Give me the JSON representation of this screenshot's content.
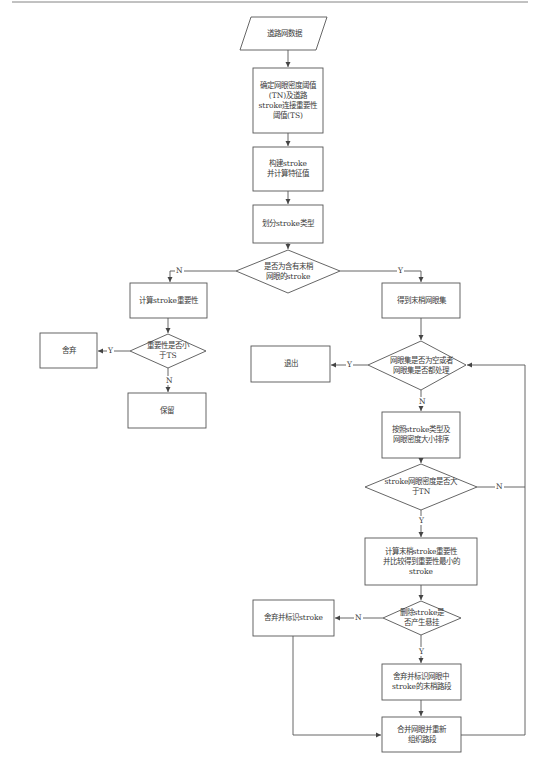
{
  "diagram": {
    "type": "flowchart",
    "nodes": {
      "road_data": {
        "shape": "parallelogram",
        "label": "道路网数据"
      },
      "thresholds": {
        "shape": "rect",
        "label": "确定网眼密度阈值\n(TN)及道路\nstroke连接重要性\n阈值(TS)"
      },
      "build_stroke": {
        "shape": "rect",
        "label": "构建stroke\n并计算特征值"
      },
      "classify_stroke": {
        "shape": "rect",
        "label": "划分stroke类型"
      },
      "has_tail_mesh": {
        "shape": "diamond",
        "label": "是否为含有末梢\n网眼的stroke"
      },
      "calc_importance": {
        "shape": "rect",
        "label": "计算stroke重要性"
      },
      "importance_lt_ts": {
        "shape": "diamond",
        "label": "重要性是否小\n于TS"
      },
      "discard": {
        "shape": "rect",
        "label": "舍弃"
      },
      "keep": {
        "shape": "rect",
        "label": "保留"
      },
      "get_tail_meshes": {
        "shape": "rect",
        "label": "得到末梢网眼集"
      },
      "mesh_set_done": {
        "shape": "diamond",
        "label": "网眼集是否为空或者\n网眼集是否都处理"
      },
      "exit": {
        "shape": "rect",
        "label": "退出"
      },
      "sort": {
        "shape": "rect",
        "label": "按照stroke类型及\n网眼密度大小排序"
      },
      "density_gt_tn": {
        "shape": "diamond",
        "label": "stroke网眼密度是否大\n于TN"
      },
      "calc_tail_importance": {
        "shape": "rect",
        "label": "计算末梢stroke重要性\n并比较得到重要性最小的\nstroke"
      },
      "delete_dangling": {
        "shape": "diamond",
        "label": "删除stroke是\n否产生悬挂"
      },
      "discard_mark_stroke": {
        "shape": "rect",
        "label": "舍弃并标识stroke"
      },
      "discard_mark_tail": {
        "shape": "rect",
        "label": "舍弃并标识网眼中\nstroke的末梢路段"
      },
      "merge_reorganize": {
        "shape": "rect",
        "label": "合并网眼并重新\n组织路段"
      }
    },
    "edge_labels": {
      "yes": "Y",
      "no": "N"
    },
    "edges": [
      {
        "from": "road_data",
        "to": "thresholds",
        "label": ""
      },
      {
        "from": "thresholds",
        "to": "build_stroke",
        "label": ""
      },
      {
        "from": "build_stroke",
        "to": "classify_stroke",
        "label": ""
      },
      {
        "from": "classify_stroke",
        "to": "has_tail_mesh",
        "label": ""
      },
      {
        "from": "has_tail_mesh",
        "to": "calc_importance",
        "label": "N"
      },
      {
        "from": "has_tail_mesh",
        "to": "get_tail_meshes",
        "label": "Y"
      },
      {
        "from": "calc_importance",
        "to": "importance_lt_ts",
        "label": ""
      },
      {
        "from": "importance_lt_ts",
        "to": "discard",
        "label": "Y"
      },
      {
        "from": "importance_lt_ts",
        "to": "keep",
        "label": "N"
      },
      {
        "from": "get_tail_meshes",
        "to": "mesh_set_done",
        "label": ""
      },
      {
        "from": "mesh_set_done",
        "to": "exit",
        "label": "Y"
      },
      {
        "from": "mesh_set_done",
        "to": "sort",
        "label": "N"
      },
      {
        "from": "sort",
        "to": "density_gt_tn",
        "label": ""
      },
      {
        "from": "density_gt_tn",
        "to": "mesh_set_done",
        "label": "N"
      },
      {
        "from": "density_gt_tn",
        "to": "calc_tail_importance",
        "label": "Y"
      },
      {
        "from": "calc_tail_importance",
        "to": "delete_dangling",
        "label": ""
      },
      {
        "from": "delete_dangling",
        "to": "discard_mark_stroke",
        "label": "N"
      },
      {
        "from": "delete_dangling",
        "to": "discard_mark_tail",
        "label": "Y"
      },
      {
        "from": "discard_mark_stroke",
        "to": "merge_reorganize",
        "label": ""
      },
      {
        "from": "discard_mark_tail",
        "to": "merge_reorganize",
        "label": ""
      },
      {
        "from": "merge_reorganize",
        "to": "mesh_set_done",
        "label": ""
      }
    ],
    "colors": {
      "stroke": "#555555",
      "text": "#3a3a3a",
      "background": "#ffffff"
    }
  }
}
